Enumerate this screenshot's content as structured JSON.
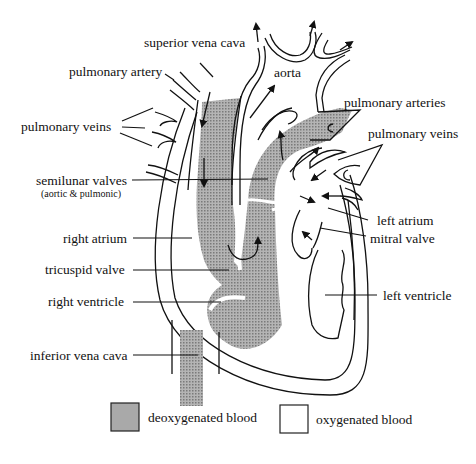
{
  "diagram": {
    "labels": {
      "superior_vena_cava": "superior vena cava",
      "pulmonary_artery": "pulmonary artery",
      "pulmonary_veins_left": "pulmonary veins",
      "aorta": "aorta",
      "pulmonary_arteries": "pulmonary arteries",
      "pulmonary_veins_right": "pulmonary veins",
      "semilunar_valves": "semilunar valves",
      "semilunar_valves_note": "(aortic & pulmonic)",
      "right_atrium": "right atrium",
      "tricuspid_valve": "tricuspid valve",
      "right_ventricle": "right ventricle",
      "inferior_vena_cava": "inferior vena cava",
      "left_atrium": "left atrium",
      "mitral_valve": "mitral valve",
      "left_ventricle": "left ventricle"
    },
    "legend": [
      {
        "label": "deoxygenated blood",
        "color": "#a9a9a9"
      },
      {
        "label": "oxygenated blood",
        "color": "#ffffff"
      }
    ]
  }
}
